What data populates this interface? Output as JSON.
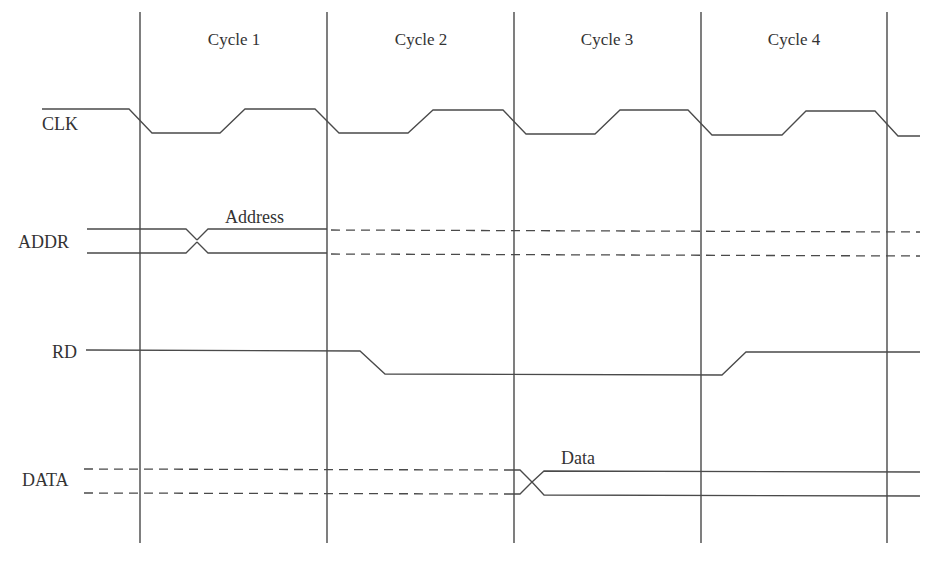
{
  "diagram": {
    "type": "timing-diagram",
    "cycles": [
      {
        "label": "Cycle 1",
        "x": 234
      },
      {
        "label": "Cycle 2",
        "x": 421
      },
      {
        "label": "Cycle 3",
        "x": 607
      },
      {
        "label": "Cycle 4",
        "x": 794
      }
    ],
    "cycle_boundaries_x": [
      140,
      327,
      514,
      701,
      887
    ],
    "signals": [
      {
        "name": "CLK",
        "overline": true,
        "kind": "clock"
      },
      {
        "name": "ADDR",
        "kind": "bus",
        "annotation": "Address"
      },
      {
        "name": "RD",
        "kind": "single"
      },
      {
        "name": "DATA",
        "kind": "bus",
        "annotation": "Data"
      }
    ]
  },
  "labels": {
    "clk": "CLK",
    "addr": "ADDR",
    "rd": "RD",
    "data": "DATA",
    "address_annotation": "Address",
    "data_annotation": "Data",
    "cycle1": "Cycle 1",
    "cycle2": "Cycle 2",
    "cycle3": "Cycle 3",
    "cycle4": "Cycle 4"
  },
  "colors": {
    "line": "#4a4a4a",
    "text": "#333333",
    "background": "#ffffff"
  }
}
